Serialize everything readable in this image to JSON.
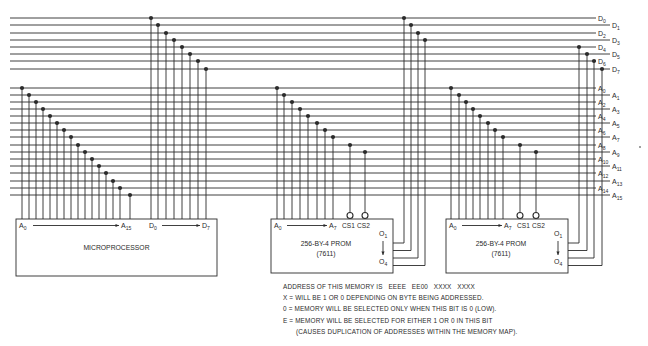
{
  "colors": {
    "line": "#2b2b2b",
    "background": "#ffffff",
    "text": "#2a2a2a"
  },
  "data_bus": {
    "x_start": 10,
    "x_end": 596,
    "y": [
      18,
      25,
      33,
      40,
      47,
      54,
      61,
      69
    ],
    "labels": [
      "D0",
      "D1",
      "D2",
      "D3",
      "D4",
      "D5",
      "D6",
      "D7"
    ]
  },
  "address_bus": {
    "x_start": 10,
    "x_end": 596,
    "y": [
      88,
      95,
      102,
      109,
      116,
      123,
      130,
      137,
      145,
      152,
      159,
      166,
      173,
      181,
      188,
      195
    ],
    "labels": [
      "A0",
      "A1",
      "A2",
      "A3",
      "A4",
      "A5",
      "A6",
      "A7",
      "A8",
      "A9",
      "A10",
      "A11",
      "A12",
      "A13",
      "A14",
      "A15"
    ]
  },
  "microprocessor": {
    "label": "MICROPROCESSOR",
    "box": {
      "x": 16,
      "y": 219,
      "w": 201,
      "h": 57
    },
    "addr_range": {
      "from": "A0",
      "to": "A15"
    },
    "data_range": {
      "from": "D0",
      "to": "D7"
    },
    "addr_taps_x": [
      22,
      29,
      36,
      43,
      50,
      57,
      64,
      71,
      78,
      85,
      92,
      99,
      106,
      113,
      120,
      130
    ],
    "data_taps_x": [
      151,
      158,
      166,
      174,
      182,
      190,
      198,
      206
    ]
  },
  "proms": [
    {
      "label": "256-BY-4 PROM",
      "part": "(7611)",
      "box": {
        "x": 271,
        "y": 219,
        "w": 122,
        "h": 54
      },
      "addr_range": {
        "from": "A0",
        "to": "A7"
      },
      "cs_labels": [
        "CS1",
        "CS2"
      ],
      "out_range": {
        "from": "O1",
        "to": "O4"
      },
      "addr_taps_x": [
        277,
        284,
        292,
        300,
        308,
        317,
        325,
        333
      ],
      "cs_taps": [
        {
          "x": 350,
          "bus": 8
        },
        {
          "x": 365,
          "bus": 9
        }
      ],
      "out_taps": [
        {
          "x": 404,
          "bus": 0
        },
        {
          "x": 411,
          "bus": 1
        },
        {
          "x": 418,
          "bus": 2
        },
        {
          "x": 425,
          "bus": 3
        }
      ]
    },
    {
      "label": "256-BY-4 PROM",
      "part": "(7611)",
      "box": {
        "x": 446,
        "y": 219,
        "w": 122,
        "h": 54
      },
      "addr_range": {
        "from": "A0",
        "to": "A7"
      },
      "cs_labels": [
        "CS1",
        "CS2"
      ],
      "out_range": {
        "from": "O1",
        "to": "O4"
      },
      "addr_taps_x": [
        451,
        459,
        466,
        473,
        480,
        488,
        495,
        503
      ],
      "cs_taps": [
        {
          "x": 520,
          "bus": 8
        },
        {
          "x": 536,
          "bus": 9
        }
      ],
      "out_taps": [
        {
          "x": 579,
          "bus": 4
        },
        {
          "x": 587,
          "bus": 5
        },
        {
          "x": 594,
          "bus": 6
        },
        {
          "x": 602,
          "bus": 7
        }
      ]
    }
  ],
  "notes": {
    "line1": "ADDRESS OF THIS MEMORY IS   EEEE   EE00   XXXX   XXXX",
    "line2": "X = WILL BE 1 OR 0 DEPENDING ON BYTE BEING ADDRESSED.",
    "line3": "0 = MEMORY WILL BE SELECTED ONLY WHEN THIS BIT IS 0 (LOW).",
    "line4": "E = MEMORY WILL BE SELECTED FOR EITHER 1 OR 0 IN THIS BIT",
    "line5": "(CAUSES DUPLICATION OF ADDRESSES WITHIN THE MEMORY MAP)."
  }
}
